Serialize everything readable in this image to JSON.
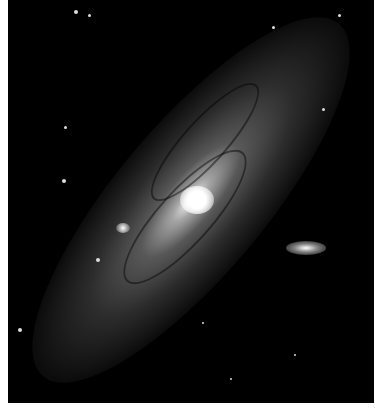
{
  "image": {
    "subject": "spiral galaxy",
    "description": "Grayscale photograph of a large inclined spiral galaxy with a bright core, dark dust lanes, two small companion galaxies and scattered foreground stars on a black background",
    "colors": {
      "background": "#000000",
      "border": "#ffffff",
      "core": "#ffffff"
    }
  }
}
